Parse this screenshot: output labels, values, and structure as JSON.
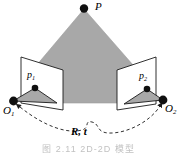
{
  "figure": {
    "type": "epipolar-two-view-geometry-diagram",
    "caption": "图 2.11   2D-2D 模型",
    "background_color": "#ffffff",
    "stroke_color": "#1a1a1a",
    "fill_gray": "#a8a8a8",
    "plane_fill": "#ffffff",
    "labels": {
      "scene_point": "P",
      "left_projection": "p",
      "left_projection_sub": "1",
      "right_projection": "p",
      "right_projection_sub": "2",
      "left_center": "O",
      "left_center_sub": "1",
      "right_center": "O",
      "right_center_sub": "2",
      "transform": "R, t"
    },
    "points": {
      "P": {
        "x": 84,
        "y": 8
      },
      "p1": {
        "x": 35,
        "y": 88
      },
      "p2": {
        "x": 147,
        "y": 89
      },
      "O1": {
        "x": 13,
        "y": 101
      },
      "O2": {
        "x": 163,
        "y": 100
      }
    },
    "shapes": {
      "scene_frustum_points": "84,9 140,73 140,103 30,103 30,73",
      "left_image_plane_points": "21,57 63,70 63,110 21,103",
      "right_image_plane_points": "156,57 117,70 117,110 156,104",
      "left_camera_triangle_points": "35,88 57,103 13,101",
      "right_camera_triangle_points": "147,89 124,104 163,100",
      "transform_curve_path": "M 20,107 C 45,127 68,134 82,130 C 90,128 84,120 92,122 C 100,124 96,132 108,133 C 126,134 150,122 160,106"
    }
  }
}
